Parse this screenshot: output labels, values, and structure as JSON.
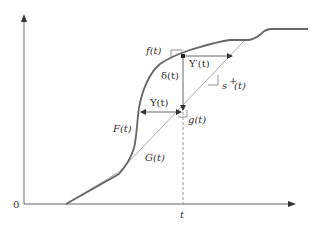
{
  "diagram": {
    "title": "",
    "axes": {
      "origin_label": "0",
      "x_tick_label": "t",
      "x_axis_arrow": true,
      "y_axis_arrow": true
    },
    "curves": [
      {
        "name": "F(t)",
        "label": "F(t)",
        "style": "dark thick"
      },
      {
        "name": "G(t)",
        "label": "G(t)",
        "style": "light thin"
      }
    ],
    "annotations": {
      "f_slope": "f(t)",
      "g_slope": "g(t)",
      "s_plus_slope": "s",
      "s_plus_sup": "+",
      "s_plus_arg": "(t)",
      "upsilon_h": "Υ(t)",
      "upsilon_prime": "Υ′(t)",
      "delta": "δ(t)"
    },
    "colors": {
      "axis": "#555555",
      "F_curve": "#666666",
      "G_curve": "#aaaaaa",
      "annotation": "#555555",
      "text": "#333333"
    }
  }
}
